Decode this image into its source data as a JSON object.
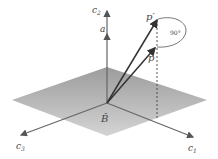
{
  "diagram": {
    "labels": {
      "c2": "c",
      "c2_sub": "2",
      "c1": "c",
      "c1_sub": "1",
      "c3": "c",
      "c3_sub": "3",
      "a": "a",
      "p_prime": "p′",
      "p": "p",
      "angle": "90°",
      "B": "B̂"
    },
    "colors": {
      "plane": "#b4b4b4",
      "axis": "#666666",
      "vector": "#333333",
      "text": "#444444"
    }
  }
}
